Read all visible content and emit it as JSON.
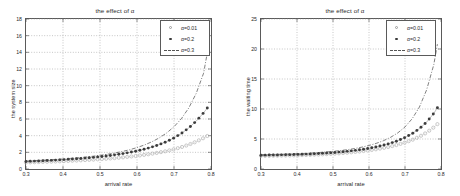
{
  "figures": [
    {
      "id": "system-size",
      "title": "the effect of α",
      "xlabel": "arrival rate",
      "ylabel": "the system size",
      "xticks": [
        "0.3",
        "0.4",
        "0.5",
        "0.6",
        "0.7",
        "0.8"
      ],
      "yticks": [
        "0",
        "2",
        "4",
        "6",
        "8",
        "10",
        "12",
        "14",
        "16",
        "18"
      ],
      "legend": [
        {
          "label": "α=0.01",
          "marker": "circle"
        },
        {
          "label": "α=0.2",
          "marker": "dot"
        },
        {
          "label": "α=0.3",
          "marker": "dashdot"
        }
      ]
    },
    {
      "id": "waiting-time",
      "title": "the effect of α",
      "xlabel": "arrival rate",
      "ylabel": "the waiting time",
      "xticks": [
        "0.3",
        "0.4",
        "0.5",
        "0.6",
        "0.7",
        "0.8"
      ],
      "yticks": [
        "0",
        "5",
        "10",
        "15",
        "20",
        "25"
      ],
      "legend": [
        {
          "label": "α=0.01",
          "marker": "circle"
        },
        {
          "label": "α=0.2",
          "marker": "dot"
        },
        {
          "label": "α=0.3",
          "marker": "dashdot"
        }
      ]
    }
  ],
  "chart_data": [
    {
      "type": "line",
      "title": "the effect of α",
      "xlabel": "arrival rate",
      "ylabel": "the system size",
      "xlim": [
        0.3,
        0.8
      ],
      "ylim": [
        0,
        18
      ],
      "xticks": [
        0.3,
        0.4,
        0.5,
        0.6,
        0.7,
        0.8
      ],
      "yticks": [
        0,
        2,
        4,
        6,
        8,
        10,
        12,
        14,
        16,
        18
      ],
      "grid": true,
      "legend_position": "top-right",
      "x": [
        0.3,
        0.32,
        0.34,
        0.36,
        0.38,
        0.4,
        0.42,
        0.44,
        0.46,
        0.48,
        0.5,
        0.52,
        0.54,
        0.56,
        0.58,
        0.6,
        0.62,
        0.64,
        0.66,
        0.68,
        0.7,
        0.72,
        0.74,
        0.76,
        0.78,
        0.79
      ],
      "series": [
        {
          "name": "α=0.01",
          "marker": "circle",
          "linestyle": "dotted",
          "values": [
            0.78,
            0.81,
            0.84,
            0.87,
            0.9,
            0.94,
            0.98,
            1.02,
            1.07,
            1.12,
            1.18,
            1.24,
            1.31,
            1.39,
            1.48,
            1.58,
            1.7,
            1.83,
            1.98,
            2.16,
            2.37,
            2.62,
            2.92,
            3.28,
            3.72,
            3.96
          ]
        },
        {
          "name": "α=0.2",
          "marker": "dot",
          "linestyle": "solid",
          "values": [
            0.9,
            0.94,
            0.98,
            1.02,
            1.07,
            1.12,
            1.18,
            1.24,
            1.31,
            1.39,
            1.48,
            1.58,
            1.7,
            1.83,
            1.99,
            2.17,
            2.38,
            2.63,
            2.93,
            3.29,
            3.73,
            4.27,
            4.93,
            5.74,
            6.74,
            7.32
          ]
        },
        {
          "name": "α=0.3",
          "marker": "none",
          "linestyle": "dashdot",
          "values": [
            0.95,
            0.99,
            1.04,
            1.09,
            1.14,
            1.2,
            1.27,
            1.34,
            1.43,
            1.53,
            1.64,
            1.77,
            1.92,
            2.1,
            2.31,
            2.57,
            2.88,
            3.26,
            3.73,
            4.32,
            5.07,
            6.04,
            7.33,
            9.07,
            11.5,
            13.95
          ]
        }
      ]
    },
    {
      "type": "line",
      "title": "the effect of α",
      "xlabel": "arrival rate",
      "ylabel": "the waiting time",
      "xlim": [
        0.3,
        0.8
      ],
      "ylim": [
        0,
        25
      ],
      "xticks": [
        0.3,
        0.4,
        0.5,
        0.6,
        0.7,
        0.8
      ],
      "yticks": [
        0,
        5,
        10,
        15,
        20,
        25
      ],
      "grid": true,
      "legend_position": "top-right",
      "x": [
        0.3,
        0.32,
        0.34,
        0.36,
        0.38,
        0.4,
        0.42,
        0.44,
        0.46,
        0.48,
        0.5,
        0.52,
        0.54,
        0.56,
        0.58,
        0.6,
        0.62,
        0.64,
        0.66,
        0.68,
        0.7,
        0.72,
        0.74,
        0.76,
        0.78,
        0.79
      ],
      "series": [
        {
          "name": "α=0.01",
          "marker": "circle",
          "linestyle": "dotted",
          "values": [
            2.18,
            2.19,
            2.21,
            2.23,
            2.25,
            2.28,
            2.32,
            2.36,
            2.41,
            2.47,
            2.54,
            2.62,
            2.72,
            2.83,
            2.96,
            3.11,
            3.29,
            3.5,
            3.75,
            4.05,
            4.41,
            4.85,
            5.39,
            6.07,
            6.95,
            7.48
          ]
        },
        {
          "name": "α=0.2",
          "marker": "dot",
          "linestyle": "solid",
          "values": [
            2.3,
            2.32,
            2.34,
            2.36,
            2.39,
            2.43,
            2.47,
            2.52,
            2.58,
            2.65,
            2.73,
            2.83,
            2.95,
            3.09,
            3.25,
            3.45,
            3.68,
            3.96,
            4.3,
            4.72,
            5.24,
            5.89,
            6.72,
            7.81,
            9.26,
            10.2
          ]
        },
        {
          "name": "α=0.3",
          "marker": "none",
          "linestyle": "dashdot",
          "values": [
            2.38,
            2.4,
            2.43,
            2.46,
            2.5,
            2.55,
            2.6,
            2.67,
            2.74,
            2.83,
            2.94,
            3.07,
            3.22,
            3.41,
            3.64,
            3.92,
            4.27,
            4.71,
            5.28,
            6.02,
            7.01,
            8.38,
            10.32,
            13.18,
            17.4,
            20.8
          ]
        }
      ]
    }
  ]
}
